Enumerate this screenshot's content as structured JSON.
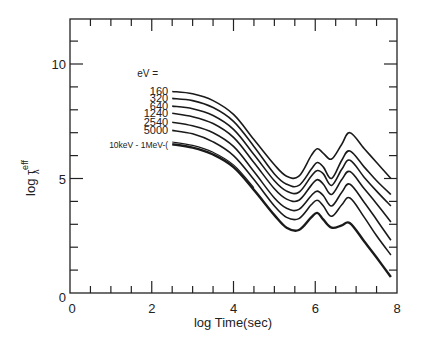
{
  "chart_data": {
    "type": "line",
    "title": "",
    "xlabel": "log Time(sec)",
    "ylabel": "log τλ^eff",
    "ylabel_main": "log τ",
    "ylabel_sup": "eff",
    "ylabel_sub": "λ",
    "xlim": [
      0,
      8
    ],
    "ylim": [
      0,
      12
    ],
    "x_ticks": [
      "0",
      "2",
      "4",
      "6",
      "8"
    ],
    "y_ticks": [
      "0",
      "5",
      "10"
    ],
    "grid": false,
    "legend_position": "inline-left-of-curves",
    "legend_header": "eV =",
    "x": [
      2.5,
      3.0,
      3.5,
      4.0,
      4.5,
      5.0,
      5.3,
      5.6,
      5.9,
      6.05,
      6.2,
      6.4,
      6.65,
      6.85,
      7.2,
      7.5,
      7.85
    ],
    "series": [
      {
        "name": "160",
        "values": [
          8.8,
          8.7,
          8.4,
          7.8,
          6.7,
          5.6,
          5.1,
          5.1,
          6.0,
          6.3,
          6.1,
          5.85,
          6.5,
          7.0,
          6.3,
          5.7,
          5.0
        ]
      },
      {
        "name": "320",
        "values": [
          8.5,
          8.4,
          8.1,
          7.5,
          6.4,
          5.2,
          4.75,
          4.7,
          5.4,
          5.7,
          5.5,
          5.0,
          5.8,
          6.2,
          5.5,
          4.9,
          4.3
        ]
      },
      {
        "name": "640",
        "values": [
          8.16,
          8.05,
          7.75,
          7.15,
          6.05,
          4.9,
          4.45,
          4.4,
          5.1,
          5.35,
          5.2,
          4.7,
          5.4,
          5.8,
          5.05,
          4.45,
          3.8
        ]
      },
      {
        "name": "1240",
        "values": [
          7.85,
          7.7,
          7.4,
          6.8,
          5.7,
          4.55,
          4.1,
          4.05,
          4.7,
          4.95,
          4.75,
          4.3,
          4.95,
          5.3,
          4.55,
          3.9,
          3.1
        ]
      },
      {
        "name": "2540",
        "values": [
          7.46,
          7.3,
          7.0,
          6.4,
          5.3,
          4.15,
          3.7,
          3.65,
          4.25,
          4.45,
          4.25,
          3.8,
          4.4,
          4.75,
          3.95,
          3.2,
          2.3
        ]
      },
      {
        "name": "5000",
        "values": [
          7.1,
          6.95,
          6.6,
          6.0,
          4.95,
          3.8,
          3.3,
          3.25,
          3.85,
          4.05,
          3.8,
          3.35,
          3.85,
          4.15,
          3.3,
          2.5,
          1.66
        ]
      },
      {
        "name": "10keV - 1MeV",
        "values": [
          6.5,
          6.35,
          6.05,
          5.5,
          4.5,
          3.4,
          2.85,
          2.75,
          3.3,
          3.5,
          3.2,
          2.85,
          2.95,
          3.05,
          2.25,
          1.55,
          0.7
        ]
      }
    ]
  },
  "legend": {
    "header": "eV =",
    "labels": [
      "160",
      "320",
      "640",
      "1240",
      "2540",
      "5000",
      "10keV - 1MeV-("
    ]
  },
  "axes": {
    "x_label": "log Time(sec)",
    "y_label_main": "log τ",
    "y_label_sup": "eff",
    "y_label_sub": "λ",
    "x_tick_labels": [
      "0",
      "2",
      "4",
      "6",
      "8"
    ],
    "y_tick_labels": [
      "0",
      "5",
      "10"
    ],
    "origin_y_label": "0",
    "origin_x_label": "0"
  },
  "colors": {
    "line": "#1a1a1a",
    "axis": "#222222",
    "background": "#ffffff"
  }
}
